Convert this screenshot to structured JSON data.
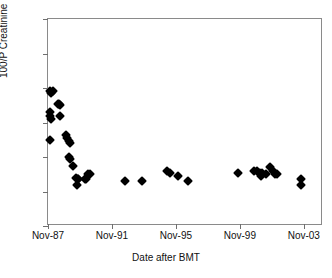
{
  "chart_data": {
    "type": "scatter",
    "title": "",
    "xlabel": "Date after BMT",
    "ylabel": "100/P Creatinine",
    "ylim": [
      0,
      120
    ],
    "ytick_values": [
      0,
      20,
      40,
      60,
      80,
      100,
      120
    ],
    "ytick_labels": [
      "0",
      "20",
      "40",
      "60",
      "80",
      "100",
      "120"
    ],
    "xtick_labels": [
      "Nov-87",
      "Nov-91",
      "Nov-95",
      "Nov-99",
      "Nov-03"
    ],
    "xtick_years": [
      1987.85,
      1991.85,
      1995.85,
      1999.85,
      2003.85
    ],
    "xlim_years": [
      1987.85,
      11.0
    ],
    "x_axis_start_year": 1987.85,
    "x_axis_end_year": 2005.05,
    "grid": false,
    "legend": false,
    "marker": "filled-diamond",
    "marker_color": "#000000",
    "series": [
      {
        "name": "100/P Creatinine",
        "points": [
          {
            "x": 1987.95,
            "y": 78
          },
          {
            "x": 1988.05,
            "y": 77
          },
          {
            "x": 1988.15,
            "y": 78
          },
          {
            "x": 1988.0,
            "y": 66
          },
          {
            "x": 1988.0,
            "y": 64
          },
          {
            "x": 1988.05,
            "y": 62
          },
          {
            "x": 1988.0,
            "y": 50
          },
          {
            "x": 1988.45,
            "y": 71
          },
          {
            "x": 1988.55,
            "y": 71
          },
          {
            "x": 1988.6,
            "y": 70
          },
          {
            "x": 1988.6,
            "y": 64
          },
          {
            "x": 1988.95,
            "y": 53
          },
          {
            "x": 1989.05,
            "y": 51
          },
          {
            "x": 1989.15,
            "y": 49
          },
          {
            "x": 1989.2,
            "y": 48
          },
          {
            "x": 1989.15,
            "y": 40
          },
          {
            "x": 1989.2,
            "y": 39
          },
          {
            "x": 1989.4,
            "y": 35
          },
          {
            "x": 1989.6,
            "y": 28
          },
          {
            "x": 1989.7,
            "y": 27
          },
          {
            "x": 1989.75,
            "y": 27
          },
          {
            "x": 1989.65,
            "y": 24
          },
          {
            "x": 1990.15,
            "y": 27
          },
          {
            "x": 1990.25,
            "y": 27
          },
          {
            "x": 1990.35,
            "y": 30
          },
          {
            "x": 1990.45,
            "y": 30
          },
          {
            "x": 1992.65,
            "y": 26
          },
          {
            "x": 1993.7,
            "y": 26
          },
          {
            "x": 1995.3,
            "y": 32
          },
          {
            "x": 1995.45,
            "y": 31
          },
          {
            "x": 1996.0,
            "y": 29
          },
          {
            "x": 1996.6,
            "y": 26
          },
          {
            "x": 1999.75,
            "y": 31
          },
          {
            "x": 2000.75,
            "y": 32
          },
          {
            "x": 2000.95,
            "y": 32
          },
          {
            "x": 2001.1,
            "y": 31
          },
          {
            "x": 2001.25,
            "y": 31
          },
          {
            "x": 2001.2,
            "y": 29
          },
          {
            "x": 2001.5,
            "y": 30
          },
          {
            "x": 2001.75,
            "y": 34
          },
          {
            "x": 2001.9,
            "y": 32
          },
          {
            "x": 2002.05,
            "y": 30
          },
          {
            "x": 2002.15,
            "y": 30
          },
          {
            "x": 2003.7,
            "y": 27
          },
          {
            "x": 2003.65,
            "y": 24
          }
        ]
      }
    ]
  }
}
